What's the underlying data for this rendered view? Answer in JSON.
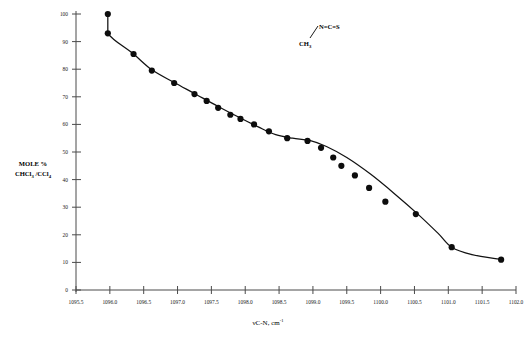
{
  "chart_data": {
    "type": "scatter",
    "title": "",
    "xlabel": "νC-N, cm⁻¹",
    "ylabel": "MOLE % CHCl₃ /CCl₄",
    "xlim": [
      1095.5,
      1102.0
    ],
    "ylim": [
      0,
      100
    ],
    "grid": false,
    "legend": false,
    "xticks": [
      1095.5,
      1096.0,
      1096.5,
      1097.0,
      1097.5,
      1098.0,
      1098.5,
      1099.0,
      1099.5,
      1100.0,
      1100.5,
      1101.0,
      1101.5,
      1102.0
    ],
    "xticklabels": [
      "1095.5",
      "1096.0",
      "1096.5",
      "1097.0",
      "1097.5",
      "1098.0",
      "1098.5",
      "1099.0",
      "1099.5",
      "1100.0",
      "1100.5",
      "1101.0",
      "1101.5",
      "1102.0"
    ],
    "yticks": [
      0,
      10,
      20,
      30,
      40,
      50,
      60,
      70,
      80,
      90,
      100
    ],
    "yticklabels": [
      "0",
      "10",
      "20",
      "30",
      "40",
      "50",
      "60",
      "70",
      "80",
      "90",
      "100"
    ],
    "points": [
      {
        "x": 1095.97,
        "y": 100.0
      },
      {
        "x": 1095.97,
        "y": 93.0
      },
      {
        "x": 1096.35,
        "y": 85.5
      },
      {
        "x": 1096.62,
        "y": 79.5
      },
      {
        "x": 1096.95,
        "y": 75.0
      },
      {
        "x": 1097.25,
        "y": 71.0
      },
      {
        "x": 1097.43,
        "y": 68.5
      },
      {
        "x": 1097.6,
        "y": 66.0
      },
      {
        "x": 1097.78,
        "y": 63.5
      },
      {
        "x": 1097.93,
        "y": 62.0
      },
      {
        "x": 1098.13,
        "y": 60.0
      },
      {
        "x": 1098.35,
        "y": 57.5
      },
      {
        "x": 1098.62,
        "y": 55.0
      },
      {
        "x": 1098.92,
        "y": 54.0
      },
      {
        "x": 1099.12,
        "y": 51.5
      },
      {
        "x": 1099.3,
        "y": 48.0
      },
      {
        "x": 1099.42,
        "y": 45.0
      },
      {
        "x": 1099.62,
        "y": 41.5
      },
      {
        "x": 1099.83,
        "y": 37.0
      },
      {
        "x": 1100.07,
        "y": 32.0
      },
      {
        "x": 1100.52,
        "y": 27.5
      },
      {
        "x": 1101.05,
        "y": 15.5
      },
      {
        "x": 1101.78,
        "y": 11.0
      }
    ],
    "curve": [
      {
        "x": 1095.97,
        "y": 100.0
      },
      {
        "x": 1095.97,
        "y": 93.0
      },
      {
        "x": 1096.35,
        "y": 85.5
      },
      {
        "x": 1096.62,
        "y": 79.8
      },
      {
        "x": 1096.95,
        "y": 75.2
      },
      {
        "x": 1097.25,
        "y": 71.2
      },
      {
        "x": 1097.6,
        "y": 66.5
      },
      {
        "x": 1097.93,
        "y": 62.3
      },
      {
        "x": 1098.2,
        "y": 59.0
      },
      {
        "x": 1098.45,
        "y": 56.3
      },
      {
        "x": 1098.7,
        "y": 55.0
      },
      {
        "x": 1098.95,
        "y": 54.2
      },
      {
        "x": 1099.2,
        "y": 52.0
      },
      {
        "x": 1099.5,
        "y": 48.0
      },
      {
        "x": 1099.85,
        "y": 42.0
      },
      {
        "x": 1100.2,
        "y": 35.0
      },
      {
        "x": 1100.55,
        "y": 27.5
      },
      {
        "x": 1100.85,
        "y": 20.5
      },
      {
        "x": 1101.05,
        "y": 15.5
      },
      {
        "x": 1101.35,
        "y": 12.8
      },
      {
        "x": 1101.78,
        "y": 11.0
      }
    ],
    "annotation": {
      "name": "methyl-isothiocyanate-structure",
      "top_label": "N=C=S",
      "bottom_label": "CH",
      "bottom_subscript": "3"
    }
  },
  "axis_titles": {
    "x_main": "νC-N, cm",
    "x_superscript": "-1",
    "y_line1": "MOLE %",
    "y_line2_a": "CHCl",
    "y_line2_sub1": "3",
    "y_line2_b": " /CCl",
    "y_line2_sub2": "4"
  }
}
